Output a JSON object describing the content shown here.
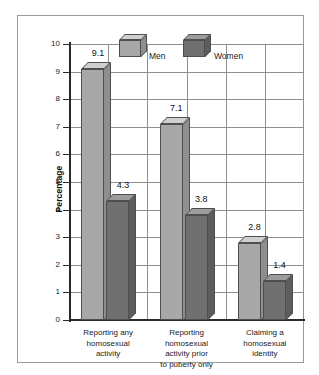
{
  "chart_data": {
    "type": "bar",
    "title": "",
    "subtitle": "",
    "xlabel": "",
    "ylabel": "Percentage",
    "ylim": [
      0,
      10
    ],
    "ytick_labels": [
      "10",
      "9",
      "8",
      "7",
      "6",
      "5",
      "4",
      "3",
      "2",
      "1",
      "0"
    ],
    "yticks": [
      10,
      9,
      8,
      7,
      6,
      5,
      4,
      3,
      2,
      1,
      0
    ],
    "grid": true,
    "legend_position": "inside-top",
    "categories": [
      "Reporting any homosexual activity",
      "Reporting homosexual activity prior to puberty only",
      "Claiming a homosexual identity"
    ],
    "category_lines": [
      [
        "Reporting any",
        "homosexual",
        "activity"
      ],
      [
        "Reporting",
        "homosexual",
        "activity prior",
        "to puberty only"
      ],
      [
        "Claiming a",
        "homosexual",
        "identity"
      ]
    ],
    "series": [
      {
        "name": "Men",
        "color": "#a8a8a8",
        "values": [
          9.1,
          7.1,
          2.8
        ],
        "value_labels": [
          "9.1",
          "7.1",
          "2.8"
        ]
      },
      {
        "name": "Women",
        "color": "#707070",
        "values": [
          4.3,
          3.8,
          1.4
        ],
        "value_labels": [
          "4.3",
          "3.8",
          "1.4"
        ]
      }
    ]
  },
  "legend": {
    "items": [
      {
        "label": "Men",
        "swatch": "cube-light-gray"
      },
      {
        "label": "Women",
        "swatch": "cube-dark-gray"
      }
    ]
  },
  "axis": {
    "y_label": "Percentage"
  }
}
